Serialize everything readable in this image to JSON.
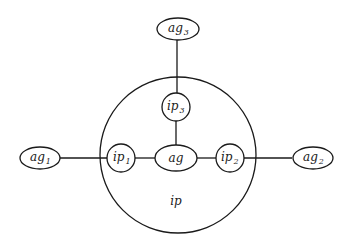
{
  "diagram": {
    "type": "graph",
    "container": {
      "id": "ip",
      "label": "ip",
      "shape": "circle"
    },
    "nodes": [
      {
        "id": "ag3",
        "base": "ag",
        "sub": "3",
        "shape": "ellipse",
        "inside_container": false
      },
      {
        "id": "ip3",
        "base": "ip",
        "sub": "3",
        "shape": "circle",
        "inside_container": true
      },
      {
        "id": "ag1",
        "base": "ag",
        "sub": "1",
        "shape": "ellipse",
        "inside_container": false
      },
      {
        "id": "ip1",
        "base": "ip",
        "sub": "1",
        "shape": "circle",
        "inside_container": true
      },
      {
        "id": "ag",
        "base": "ag",
        "sub": "",
        "shape": "ellipse",
        "inside_container": true
      },
      {
        "id": "ip2",
        "base": "ip",
        "sub": "2",
        "shape": "circle",
        "inside_container": true
      },
      {
        "id": "ag2",
        "base": "ag",
        "sub": "2",
        "shape": "ellipse",
        "inside_container": false
      }
    ],
    "edges": [
      {
        "from": "ag3",
        "to": "ip3"
      },
      {
        "from": "ip3",
        "to": "ag"
      },
      {
        "from": "ag1",
        "to": "ip1"
      },
      {
        "from": "ip1",
        "to": "ag"
      },
      {
        "from": "ag",
        "to": "ip2"
      },
      {
        "from": "ip2",
        "to": "ag2"
      }
    ],
    "colors": {
      "line": "#1a1a1a",
      "background": "#ffffff"
    }
  }
}
